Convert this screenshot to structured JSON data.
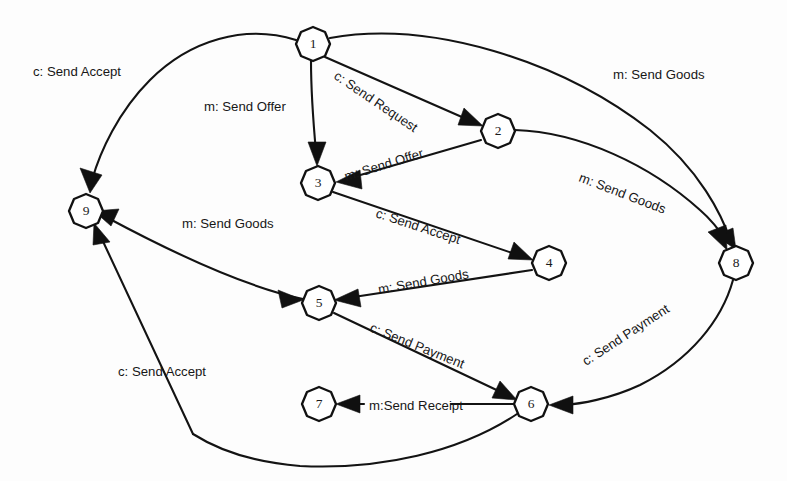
{
  "diagram": {
    "background_color": "#fdfdfd",
    "stroke_color": "#111111",
    "node_fill": "#ffffff",
    "nodes": [
      {
        "id": "1",
        "label": "1",
        "x": 313,
        "y": 44,
        "r": 17
      },
      {
        "id": "2",
        "label": "2",
        "x": 498,
        "y": 131,
        "r": 17
      },
      {
        "id": "3",
        "label": "3",
        "x": 318,
        "y": 183,
        "r": 17
      },
      {
        "id": "4",
        "label": "4",
        "x": 549,
        "y": 263,
        "r": 17
      },
      {
        "id": "5",
        "label": "5",
        "x": 319,
        "y": 303,
        "r": 17
      },
      {
        "id": "6",
        "label": "6",
        "x": 531,
        "y": 404,
        "r": 17
      },
      {
        "id": "7",
        "label": "7",
        "x": 319,
        "y": 404,
        "r": 17
      },
      {
        "id": "8",
        "label": "8",
        "x": 736,
        "y": 263,
        "r": 17
      },
      {
        "id": "9",
        "label": "9",
        "x": 86,
        "y": 211,
        "r": 17
      }
    ],
    "edges": [
      {
        "id": "e1",
        "from": "1",
        "to": "9",
        "label": "c: Send Accept",
        "label_x": 33,
        "label_y": 70,
        "rotation": 0
      },
      {
        "id": "e2",
        "from": "1",
        "to": "3",
        "label": "m: Send Offer",
        "label_x": 204,
        "label_y": 105,
        "rotation": 0
      },
      {
        "id": "e3",
        "from": "1",
        "to": "2",
        "label": "c: Send Request",
        "label_x": 333,
        "label_y": 72,
        "rotation": 34
      },
      {
        "id": "e4",
        "from": "1",
        "to": "8",
        "label": "m: Send Goods",
        "label_x": 613,
        "label_y": 73,
        "rotation": 0
      },
      {
        "id": "e5",
        "from": "2",
        "to": "3",
        "label": "m: Send Offer",
        "label_x": 343,
        "label_y": 175,
        "rotation": -22
      },
      {
        "id": "e6",
        "from": "2",
        "to": "8",
        "label": "m: Send Goods",
        "label_x": 578,
        "label_y": 175,
        "rotation": 21
      },
      {
        "id": "e7",
        "from": "3",
        "to": "4",
        "label": "c: Send Accept",
        "label_x": 375,
        "label_y": 211,
        "rotation": 18
      },
      {
        "id": "e8",
        "from": "4",
        "to": "5",
        "label": "m: Send Goods",
        "label_x": 379,
        "label_y": 288,
        "rotation": -10
      },
      {
        "id": "e9",
        "from": "5",
        "to": "9",
        "label": "m: Send Goods",
        "label_x": 182,
        "label_y": 222,
        "rotation": 0
      },
      {
        "id": "e10",
        "from": "5",
        "to": "6",
        "label": "c: Send Payment",
        "label_x": 371,
        "label_y": 325,
        "rotation": 22
      },
      {
        "id": "e11",
        "from": "6",
        "to": "7",
        "label": "m:Send Receipt",
        "label_x": 371,
        "label_y": 405,
        "rotation": 0
      },
      {
        "id": "e12",
        "from": "8",
        "to": "6",
        "label": "c: Send Payment",
        "label_x": 586,
        "label_y": 360,
        "rotation": -33
      },
      {
        "id": "e13",
        "from": "6",
        "to": "9",
        "label": "c: Send Accept",
        "label_x": 118,
        "label_y": 370,
        "rotation": 0
      }
    ]
  }
}
